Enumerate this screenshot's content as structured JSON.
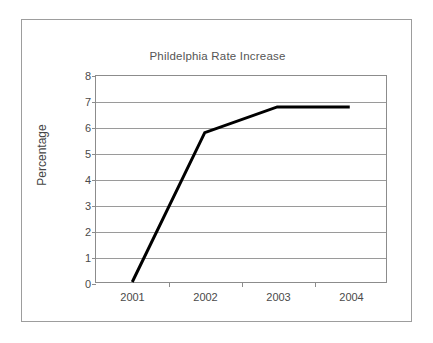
{
  "chart_data": {
    "type": "line",
    "title": "Phildelphia Rate Increase",
    "xlabel": "",
    "ylabel": "Percentage",
    "categories": [
      "2001",
      "2002",
      "2003",
      "2004"
    ],
    "values": [
      0,
      5.8,
      6.8,
      6.8
    ],
    "series": [
      {
        "name": "Rate Increase",
        "values": [
          0,
          5.8,
          6.8,
          6.8
        ],
        "color": "#000000"
      }
    ],
    "ylim": [
      0,
      8
    ],
    "y_ticks": [
      0,
      1,
      2,
      3,
      4,
      5,
      6,
      7,
      8
    ],
    "y_tick_labels": [
      "0",
      "1",
      "2",
      "3",
      "4",
      "5",
      "6",
      "7",
      "8"
    ],
    "x_tick_labels": [
      "2001",
      "2002",
      "2003",
      "2004"
    ],
    "grid": "horizontal",
    "legend": "none",
    "background": "#ffffff",
    "grid_color": "#9a9a9a",
    "axis_color": "#8c8c8c",
    "border_color": "#9d9d9d",
    "title_color": "#555555",
    "label_color": "#4a4a4a"
  }
}
